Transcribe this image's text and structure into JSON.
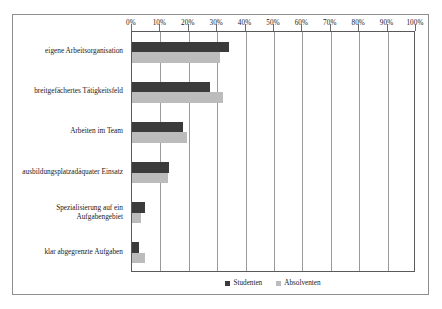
{
  "chart_data": {
    "type": "bar",
    "orientation": "horizontal",
    "title": "",
    "subtitle": "",
    "xlabel": "",
    "ylabel": "",
    "xlim": [
      0,
      100
    ],
    "xunit": "%",
    "grid": true,
    "legend_position": "bottom",
    "categories": [
      "eigene Arbeitsorganisation",
      "breitgefächertes Tätigkeitsfeld",
      "Arbeiten im Team",
      "ausbildungsplatzadäquater Einsatz",
      "Spezialisierung auf ein Aufgabengebiet",
      "klar abgegrenzte Aufgaben"
    ],
    "series": [
      {
        "name": "Studenten",
        "color": "#3b3b3b",
        "values": [
          34,
          27.5,
          18,
          13,
          4.5,
          2.5
        ]
      },
      {
        "name": "Absolventen",
        "color": "#bcbcbc",
        "values": [
          31,
          32,
          19.5,
          12.5,
          3,
          4.5
        ]
      }
    ],
    "xticks": [
      0,
      10,
      20,
      30,
      40,
      50,
      60,
      70,
      80,
      90,
      100
    ],
    "xticklabels": [
      "0%",
      "10%",
      "20%",
      "30%",
      "40%",
      "50%",
      "60%",
      "70%",
      "80%",
      "90%",
      "100%"
    ]
  },
  "legend": {
    "items": [
      {
        "label": "Studenten",
        "swatch": "students"
      },
      {
        "label": "Absolventen",
        "swatch": "graduates"
      }
    ]
  }
}
